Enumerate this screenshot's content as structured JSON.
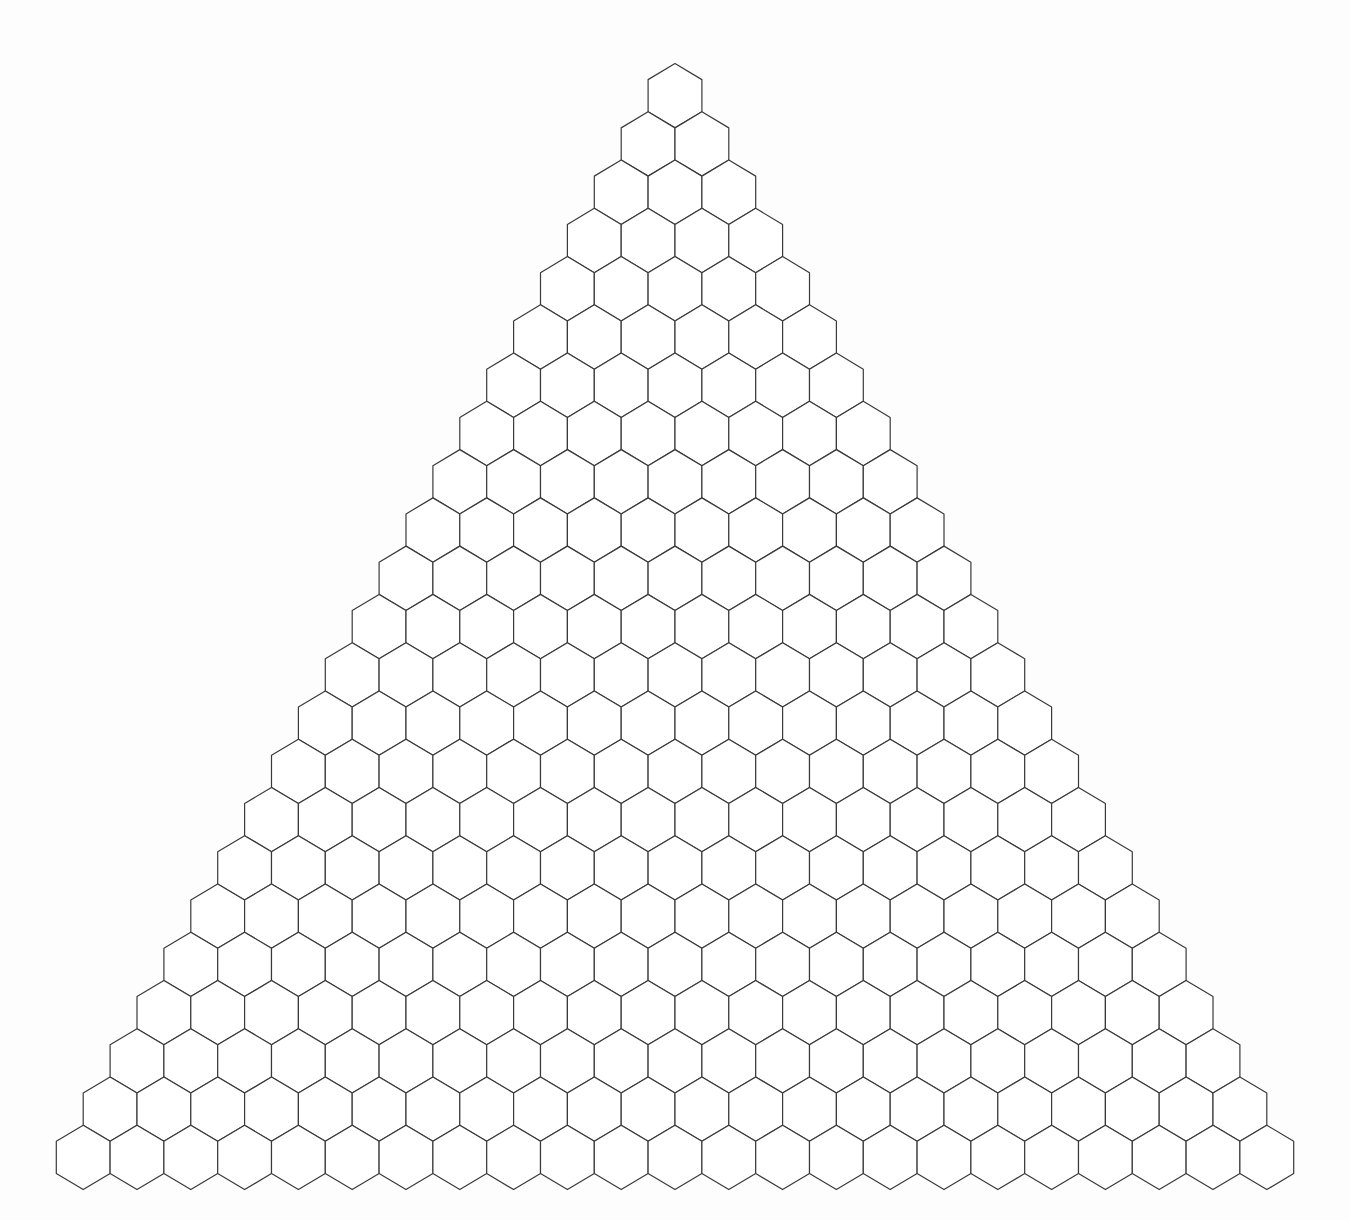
{
  "diagram": {
    "type": "hexagonal-triangular-grid",
    "rows": 23,
    "hexes_per_row_start": 1,
    "hexes_per_row_increment": 1,
    "total_hexes": 276,
    "apex_center": {
      "x": 675,
      "y": 95.7
    },
    "column_spacing": 53.8,
    "row_spacing": 48.26,
    "hex_half_width": 26.9,
    "hex_vertical_radius": 32.17,
    "colors": {
      "background": "#fdfdfd",
      "hex_fill": "#ffffff",
      "hex_stroke": "#3a3a3a"
    }
  }
}
